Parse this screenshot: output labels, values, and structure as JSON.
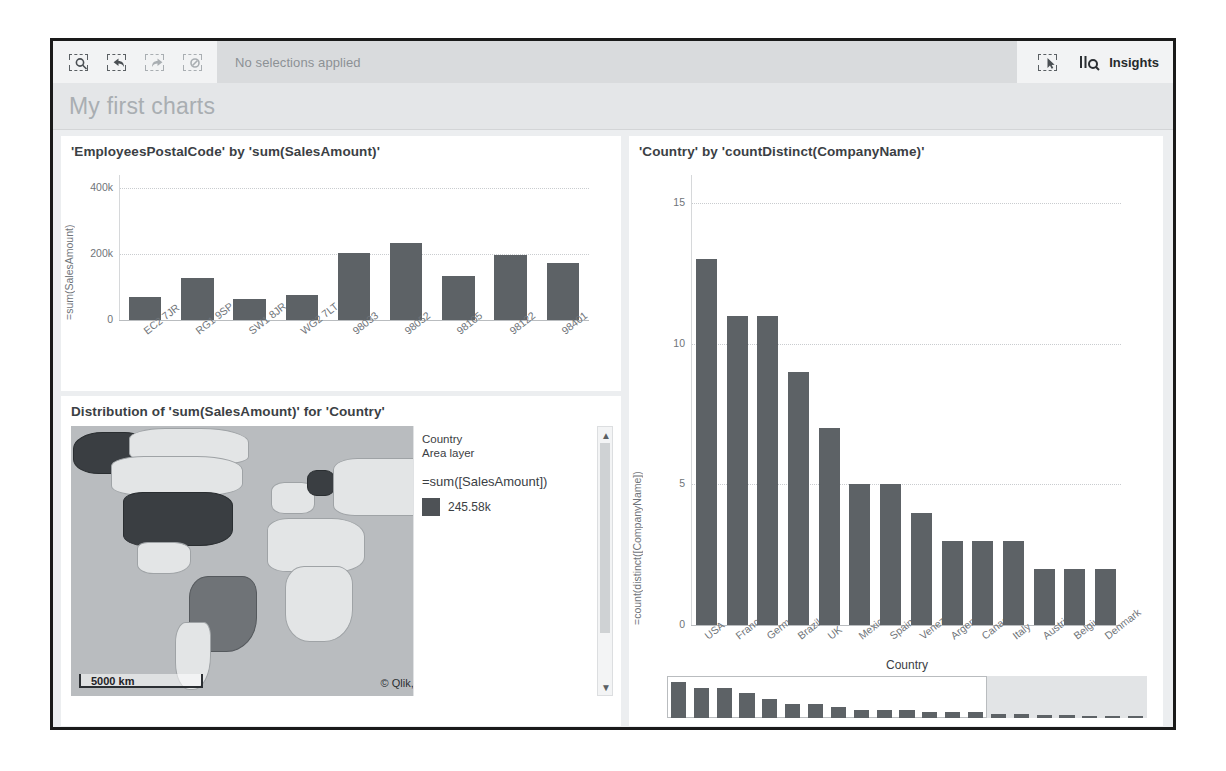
{
  "toolbar": {
    "icons": [
      {
        "name": "selection-search-icon",
        "state": "active"
      },
      {
        "name": "selection-undo-icon",
        "state": "active"
      },
      {
        "name": "selection-redo-icon",
        "state": "disabled"
      },
      {
        "name": "selection-clear-icon",
        "state": "disabled"
      }
    ],
    "status": "No selections applied",
    "smart_search_icon": "selection-tool-icon",
    "insights_icon": "insights-bar-search-icon",
    "insights_label": "Insights"
  },
  "sheet": {
    "title": "My first charts"
  },
  "colors": {
    "bar": "#5d6266",
    "panel": "#eceef0",
    "card": "#ffffff",
    "text": "#3b4044",
    "muted": "#6f7479"
  },
  "map_card": {
    "title": "Distribution of 'sum(SalesAmount)' for 'Country'",
    "legend": {
      "dimension": "Country",
      "layer": "Area layer",
      "measure": "=sum([SalesAmount])",
      "max_value": "245.58k"
    },
    "scale_label": "5000 km",
    "attribution_prefix": "© Qlik,",
    "attribution_link": "OpenStreetMap contributors",
    "scroll_up_icon": "chevron-up-icon",
    "scroll_down_icon": "chevron-down-icon"
  },
  "mini_scroll": {
    "label": "Country"
  },
  "chart_data": [
    {
      "type": "bar",
      "title": "'EmployeesPostalCode' by 'sum(SalesAmount)'",
      "ylabel": "=sum(SalesAmount)",
      "xlabel": "",
      "categories": [
        "EC2 7JR",
        "RG1 9SP",
        "SW1 8JR",
        "WG2 7LT",
        "98033",
        "98052",
        "98105",
        "98122",
        "98401"
      ],
      "values": [
        70000,
        127000,
        65000,
        75000,
        203000,
        233000,
        133000,
        198000,
        172000
      ],
      "ylim": [
        0,
        440000
      ],
      "yticks": [
        0,
        200000,
        400000
      ],
      "ytick_labels": [
        "0",
        "200k",
        "400k"
      ],
      "grid": true,
      "legend": "none"
    },
    {
      "type": "bar",
      "title": "'Country' by 'countDistinct(CompanyName)'",
      "ylabel": "=count(distinct([CompanyName])",
      "xlabel": "",
      "categories": [
        "USA",
        "France",
        "Germany",
        "Brazil",
        "UK",
        "Mexico",
        "Spain",
        "Venezuela",
        "Argentina",
        "Canada",
        "Italy",
        "Austria",
        "Belgium",
        "Denmark"
      ],
      "values": [
        13,
        11,
        11,
        9,
        7,
        5,
        5,
        4,
        3,
        3,
        3,
        2,
        2,
        2
      ],
      "ylim": [
        0,
        16
      ],
      "yticks": [
        0,
        5,
        10,
        15
      ],
      "ytick_labels": [
        "0",
        "5",
        "10",
        "15"
      ],
      "grid": true,
      "legend": "none"
    },
    {
      "type": "bar",
      "title": "Country",
      "categories": [
        "1",
        "2",
        "3",
        "4",
        "5",
        "6",
        "7",
        "8",
        "9",
        "10",
        "11",
        "12",
        "13",
        "14",
        "15",
        "16",
        "17",
        "18",
        "19",
        "20",
        "21"
      ],
      "values": [
        13,
        11,
        11,
        9,
        7,
        5,
        5,
        4,
        3,
        3,
        3,
        2,
        2,
        2,
        1.6,
        1.4,
        1.2,
        1,
        0.9,
        0.8,
        0.7
      ],
      "ylim": [
        0,
        14
      ],
      "grid": false,
      "legend": "none",
      "window": {
        "start": 0,
        "end": 14
      }
    }
  ]
}
